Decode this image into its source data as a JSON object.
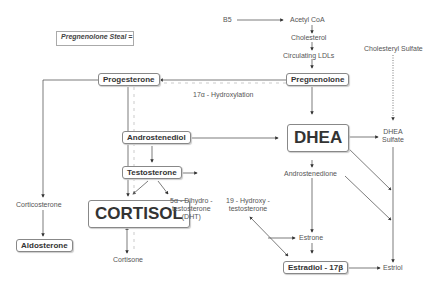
{
  "diagram": {
    "legend": {
      "label": "Pregnenolone Steal ="
    },
    "nodes": {
      "b5": "B5",
      "acetyl_coa": "Acetyl CoA",
      "cholesterol": "Cholesterol",
      "circulating_ldls": "Circulating LDLs",
      "pregnenolone": "Pregnenolone",
      "cholesteryl_sulfate": "Cholesteryl Sulfate",
      "progesterone": "Progesterone",
      "hydroxylation": "17α - Hydroxylation",
      "androstenediol": "Androstenediol",
      "dhea": "DHEA",
      "dhea_sulfate_1": "DHEA",
      "dhea_sulfate_2": "Sulfate",
      "testosterone": "Testosterone",
      "androstenedione": "Androstenedione",
      "corticosterone": "Corticosterone",
      "cortisol": "CORTISOL",
      "dht_1": "5α - Dihydro -",
      "dht_2": "testosterone",
      "dht_3": "(DHT)",
      "hydroxy_t_1": "19 - Hydroxy -",
      "hydroxy_t_2": "testosterone",
      "aldosterone": "Aldosterone",
      "cortisone": "Cortisone",
      "estrone": "Estrone",
      "estradiol": "Estradiol - 17β",
      "estriol": "Estriol"
    }
  }
}
